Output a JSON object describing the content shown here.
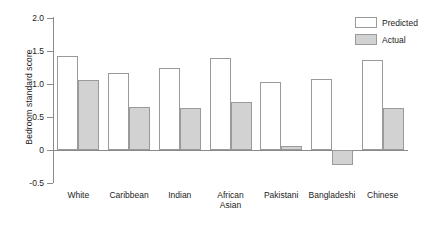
{
  "chart_data": {
    "type": "bar",
    "title": "",
    "xlabel": "",
    "ylabel": "Bedroom standard score",
    "ylim": [
      -0.5,
      2.0
    ],
    "yticks": [
      2.0,
      1.5,
      1.0,
      0.5,
      0,
      -0.5
    ],
    "ytick_labels": [
      "2.0",
      "1.5",
      "1.0",
      "0.5",
      "0",
      "-0.5"
    ],
    "grid": false,
    "legend_position": "top-right",
    "categories": [
      "White",
      "Caribbean",
      "Indian",
      "African\nAsian",
      "Pakistani",
      "Bangladeshi",
      "Chinese"
    ],
    "series": [
      {
        "name": "Predicted",
        "color": "#ffffff",
        "values": [
          1.43,
          1.16,
          1.25,
          1.4,
          1.03,
          1.07,
          1.37
        ]
      },
      {
        "name": "Actual",
        "color": "#d2d2d2",
        "values": [
          1.06,
          0.65,
          0.63,
          0.72,
          0.06,
          -0.22,
          0.64
        ]
      }
    ]
  },
  "legend": {
    "items": [
      {
        "label": "Predicted",
        "swatch": "predicted"
      },
      {
        "label": "Actual",
        "swatch": "actual"
      }
    ]
  },
  "colors": {
    "axis": "#8a8a8a",
    "bar_outline": "#9a9a9a",
    "actual_fill": "#d2d2d2",
    "predicted_fill": "#ffffff",
    "text": "#1c1c1c"
  }
}
